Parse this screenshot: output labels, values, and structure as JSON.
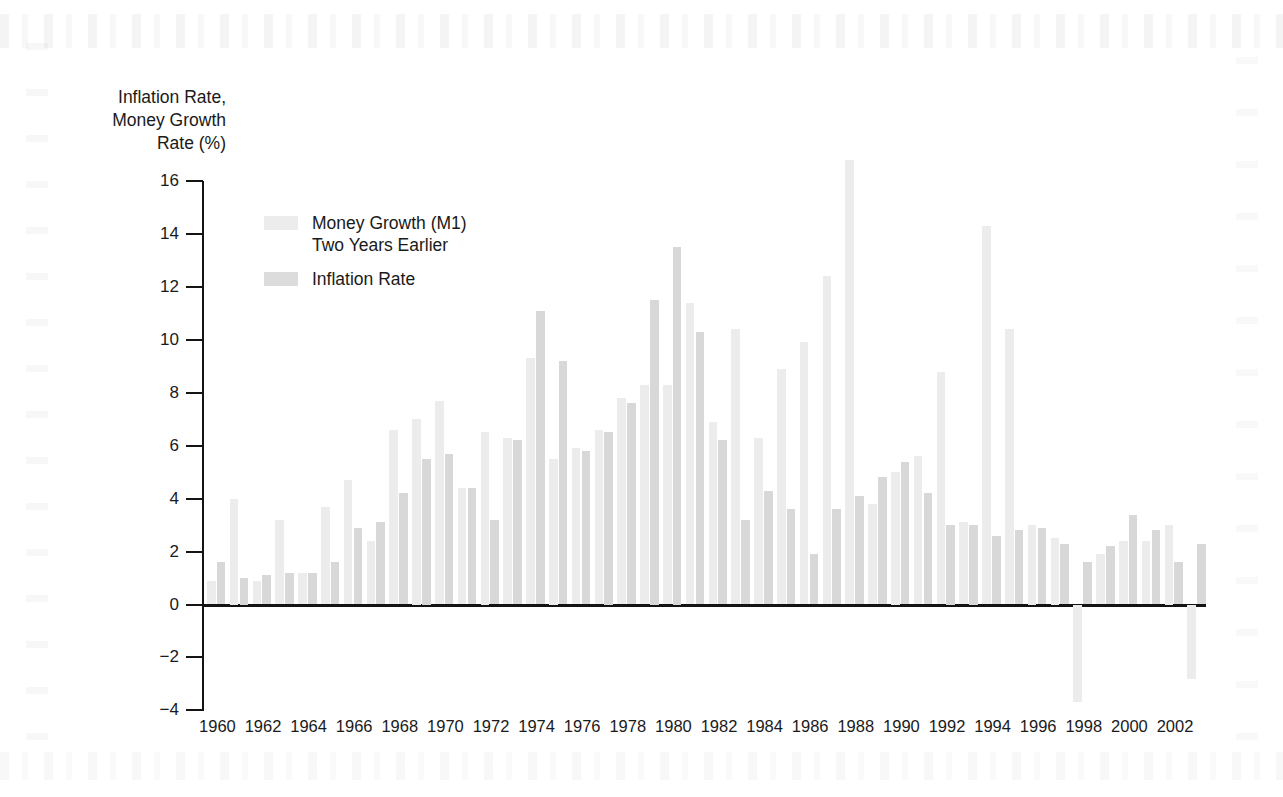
{
  "chart_data": {
    "type": "bar",
    "title": "",
    "subtitle": "",
    "ylabel": "Inflation Rate,\nMoney Growth\nRate (%)",
    "xlabel": "",
    "ylim": [
      -4,
      16
    ],
    "y_ticks": [
      16,
      14,
      12,
      10,
      8,
      6,
      4,
      2,
      0,
      -2,
      -4
    ],
    "y_tick_labels": [
      "16",
      "14",
      "12",
      "10",
      "8",
      "6",
      "4",
      "2",
      "0",
      "−2",
      "−4"
    ],
    "grid": false,
    "legend_position": "upper-left-inside",
    "x": [
      1960,
      1961,
      1962,
      1963,
      1964,
      1965,
      1966,
      1967,
      1968,
      1969,
      1970,
      1971,
      1972,
      1973,
      1974,
      1975,
      1976,
      1977,
      1978,
      1979,
      1980,
      1981,
      1982,
      1983,
      1984,
      1985,
      1986,
      1987,
      1988,
      1989,
      1990,
      1991,
      1992,
      1993,
      1994,
      1995,
      1996,
      1997,
      1998,
      1999,
      2000,
      2001,
      2002,
      2003
    ],
    "x_tick_labels": [
      "1960",
      "1962",
      "1964",
      "1966",
      "1968",
      "1970",
      "1972",
      "1974",
      "1976",
      "1978",
      "1980",
      "1982",
      "1984",
      "1986",
      "1988",
      "1990",
      "1992",
      "1994",
      "1996",
      "1998",
      "2000",
      "2002"
    ],
    "x_tick_values": [
      1960,
      1962,
      1964,
      1966,
      1968,
      1970,
      1972,
      1974,
      1976,
      1978,
      1980,
      1982,
      1984,
      1986,
      1988,
      1990,
      1992,
      1994,
      1996,
      1998,
      2000,
      2002
    ],
    "series": [
      {
        "name": "Money Growth (M1) Two Years Earlier",
        "color": "#ececec",
        "values": [
          0.9,
          4.0,
          0.9,
          3.2,
          1.2,
          3.7,
          4.7,
          2.4,
          6.6,
          7.0,
          7.7,
          4.4,
          6.5,
          6.3,
          9.3,
          5.5,
          5.9,
          6.6,
          7.8,
          8.3,
          8.3,
          11.4,
          6.9,
          10.4,
          6.3,
          8.9,
          9.9,
          12.4,
          16.8,
          3.8,
          5.0,
          5.6,
          8.8,
          3.1,
          14.3,
          10.4,
          3.0,
          2.5,
          -3.7,
          1.9,
          2.4,
          2.4,
          3.0,
          -2.8
        ]
      },
      {
        "name": "Inflation Rate",
        "color": "#d8d8d8",
        "values": [
          1.6,
          1.0,
          1.1,
          1.2,
          1.2,
          1.6,
          2.9,
          3.1,
          4.2,
          5.5,
          5.7,
          4.4,
          3.2,
          6.2,
          11.1,
          9.2,
          5.8,
          6.5,
          7.6,
          11.5,
          13.5,
          10.3,
          6.2,
          3.2,
          4.3,
          3.6,
          1.9,
          3.6,
          4.1,
          4.8,
          5.4,
          4.2,
          3.0,
          3.0,
          2.6,
          2.8,
          2.9,
          2.3,
          1.6,
          2.2,
          3.4,
          2.8,
          1.6,
          2.3
        ]
      }
    ],
    "note": "Paired vertical bars per year; light bars = money growth lagged two years, darker bars = inflation rate."
  },
  "legend": {
    "money_label": "Money Growth (M1)\nTwo Years Earlier",
    "inflation_label": "Inflation Rate"
  }
}
